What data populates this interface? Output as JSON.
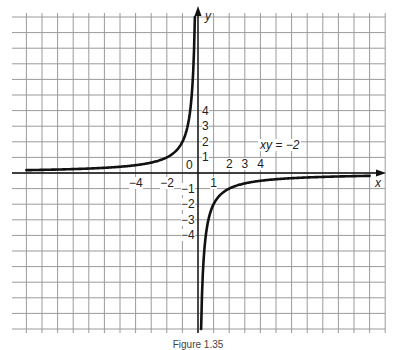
{
  "chart_data": {
    "type": "line",
    "title": "",
    "equation_label": "xy = −2",
    "xlabel": "x",
    "ylabel": "y",
    "origin_label": "0",
    "x_ticks": [
      {
        "v": -4,
        "t": "−4"
      },
      {
        "v": -2,
        "t": "−2"
      },
      {
        "v": 1,
        "t": "1"
      },
      {
        "v": 2,
        "t": "2"
      },
      {
        "v": 3,
        "t": "3"
      },
      {
        "v": 4,
        "t": "4"
      }
    ],
    "y_ticks": [
      {
        "v": 4,
        "t": "4"
      },
      {
        "v": 3,
        "t": "3"
      },
      {
        "v": 2,
        "t": "2"
      },
      {
        "v": 1,
        "t": "1"
      },
      {
        "v": -1,
        "t": "−1"
      },
      {
        "v": -2,
        "t": "−2"
      },
      {
        "v": -3,
        "t": "−3"
      },
      {
        "v": -4,
        "t": "−4"
      }
    ],
    "grid": true,
    "xlim": [
      -11.9,
      11.9
    ],
    "ylim": [
      -10.2,
      10.2
    ],
    "series": [
      {
        "name": "xy = −2 (x<0 branch)",
        "x": [
          -11,
          -8,
          -6,
          -4,
          -3,
          -2,
          -1.5,
          -1,
          -0.5,
          -0.3,
          -0.2
        ],
        "y": [
          0.18,
          0.25,
          0.33,
          0.5,
          0.67,
          1,
          1.33,
          2,
          4,
          6.67,
          10
        ]
      },
      {
        "name": "xy = −2 (x>0 branch)",
        "x": [
          0.2,
          0.3,
          0.5,
          1,
          1.5,
          2,
          3,
          4,
          6,
          8,
          11
        ],
        "y": [
          -10,
          -6.67,
          -4,
          -2,
          -1.33,
          -1,
          -0.67,
          -0.5,
          -0.33,
          -0.25,
          -0.18
        ]
      }
    ]
  },
  "caption": "Figure 1.35"
}
